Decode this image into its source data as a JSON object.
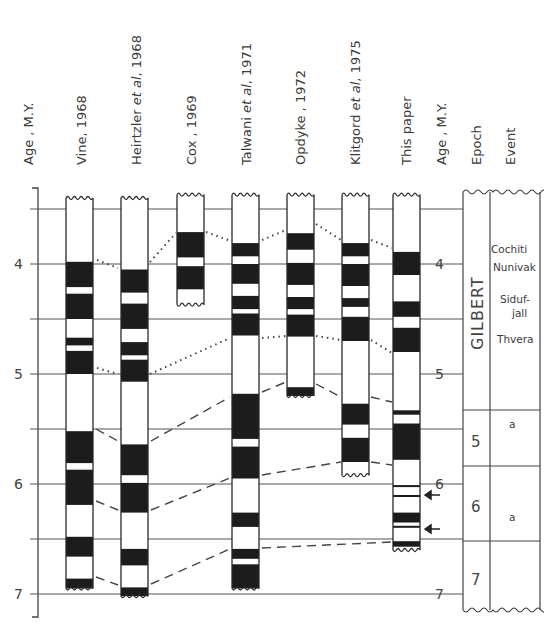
{
  "chart_data": {
    "type": "magnetostratigraphic-correlation",
    "title": "",
    "ylabel": "Age, M.Y.",
    "yticks": [
      4,
      5,
      6,
      7
    ],
    "ylim": [
      3.4,
      7.1
    ],
    "gridlines_at": [
      3.5,
      4.0,
      4.5,
      5.0,
      5.5,
      6.0,
      6.5,
      7.0
    ],
    "columns": [
      {
        "name": "Vine, 1968",
        "top": 3.4,
        "bottom": 6.95,
        "normal_intervals": [
          [
            3.98,
            4.21
          ],
          [
            4.27,
            4.5
          ],
          [
            4.67,
            4.74
          ],
          [
            4.79,
            5.0
          ],
          [
            5.52,
            5.81
          ],
          [
            5.87,
            6.19
          ],
          [
            6.48,
            6.66
          ],
          [
            6.86,
            6.95
          ]
        ]
      },
      {
        "name": "Heirtzler et al, 1968",
        "top": 3.4,
        "bottom": 7.02,
        "normal_intervals": [
          [
            4.05,
            4.26
          ],
          [
            4.36,
            4.59
          ],
          [
            4.71,
            4.83
          ],
          [
            4.87,
            5.07
          ],
          [
            5.64,
            5.92
          ],
          [
            5.99,
            6.26
          ],
          [
            6.59,
            6.74
          ],
          [
            6.94,
            7.02
          ]
        ]
      },
      {
        "name": "Cox, 1969",
        "top": 3.37,
        "bottom": 4.37,
        "normal_intervals": [
          [
            3.71,
            3.94
          ],
          [
            4.02,
            4.23
          ]
        ]
      },
      {
        "name": "Talwani et al, 1971",
        "top": 3.37,
        "bottom": 6.95,
        "normal_intervals": [
          [
            3.81,
            3.93
          ],
          [
            4.0,
            4.18
          ],
          [
            4.29,
            4.41
          ],
          [
            4.45,
            4.65
          ],
          [
            5.18,
            5.59
          ],
          [
            5.66,
            5.95
          ],
          [
            6.26,
            6.39
          ],
          [
            6.59,
            6.68
          ],
          [
            6.73,
            6.95
          ]
        ]
      },
      {
        "name": "Opdyke, 1972",
        "top": 3.37,
        "bottom": 5.2,
        "normal_intervals": [
          [
            3.72,
            3.87
          ],
          [
            3.99,
            4.19
          ],
          [
            4.3,
            4.41
          ],
          [
            4.46,
            4.66
          ],
          [
            5.12,
            5.2
          ]
        ]
      },
      {
        "name": "Klitgord et al, 1975",
        "top": 3.37,
        "bottom": 5.92,
        "normal_intervals": [
          [
            3.81,
            3.93
          ],
          [
            4.0,
            4.2
          ],
          [
            4.31,
            4.39
          ],
          [
            4.48,
            4.7
          ],
          [
            5.27,
            5.46
          ],
          [
            5.58,
            5.8
          ]
        ]
      },
      {
        "name": "This paper",
        "top": 3.37,
        "bottom": 6.6,
        "normal_intervals": [
          [
            3.89,
            4.1
          ],
          [
            4.34,
            4.48
          ],
          [
            4.58,
            4.8
          ],
          [
            5.33,
            5.37
          ],
          [
            5.45,
            5.78
          ],
          [
            6.1,
            6.1
          ],
          [
            6.26,
            6.35
          ],
          [
            6.38,
            6.39
          ],
          [
            6.52,
            6.57
          ]
        ]
      }
    ],
    "arrows_at": [
      6.11,
      6.42
    ],
    "epochs": [
      {
        "label": "GILBERT",
        "from": 3.37,
        "to": 5.33
      },
      {
        "label": "5",
        "from": 5.33,
        "to": 5.84
      },
      {
        "label": "6",
        "from": 5.84,
        "to": 6.53
      },
      {
        "label": "7",
        "from": 6.53,
        "to": 7.2
      }
    ],
    "events": [
      {
        "label": "Cochiti",
        "age": 3.86
      },
      {
        "label": "Nunivak",
        "age": 4.0
      },
      {
        "label": "Siduf-jall",
        "age": 4.45
      },
      {
        "label": "Thvera",
        "age": 4.75
      },
      {
        "label": "a",
        "age": 5.45
      },
      {
        "label": "a",
        "age": 6.22
      }
    ]
  },
  "headers": {
    "age_left": "Age , M.Y.",
    "vine": "Vine, 1968",
    "heirtzler_a": "Heirtzler ",
    "heirtzler_b": "et al",
    "heirtzler_c": ", 1968",
    "cox": "Cox , 1969",
    "talwani_a": "Talwani ",
    "talwani_b": "et al",
    "talwani_c": ", 1971",
    "opdyke": "Opdyke , 1972",
    "klitgord_a": "Klitgord ",
    "klitgord_b": "et al",
    "klitgord_c": ", 1975",
    "this_paper": "This paper",
    "age_right": "Age , M.Y.",
    "epoch": "Epoch",
    "event": "Event"
  },
  "ticks": {
    "t4": "4",
    "t5": "5",
    "t6": "6",
    "t7": "7"
  },
  "epoch_labels": {
    "gilbert": "GILBERT",
    "e5": "5",
    "e6": "6",
    "e7": "7"
  },
  "event_labels": {
    "cochiti": "Cochiti",
    "nunivak": "Nunivak",
    "siduf": "Siduf-",
    "jall": "jall",
    "thvera": "Thvera",
    "a1": "a",
    "a2": "a"
  },
  "colors": {
    "ink": "#2a2a2a",
    "band": "#1c1c1c",
    "line": "#555555"
  }
}
